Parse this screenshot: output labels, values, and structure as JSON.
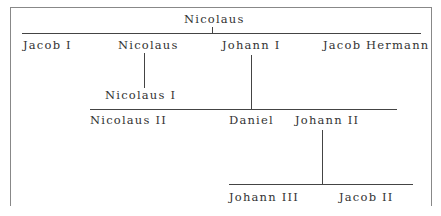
{
  "tree": {
    "root": {
      "name": "Nicolaus"
    },
    "generation1": [
      {
        "name": "Jacob I"
      },
      {
        "name": "Nicolaus"
      },
      {
        "name": "Johann I"
      },
      {
        "name": "Jacob Hermann"
      }
    ],
    "generation2_nicolaus": {
      "name": "Nicolaus I"
    },
    "generation2_johann": [
      {
        "name": "Nicolaus II"
      },
      {
        "name": "Daniel"
      },
      {
        "name": "Johann II"
      }
    ],
    "generation3_johann2": [
      {
        "name": "Johann III"
      },
      {
        "name": "Jacob II"
      }
    ]
  }
}
